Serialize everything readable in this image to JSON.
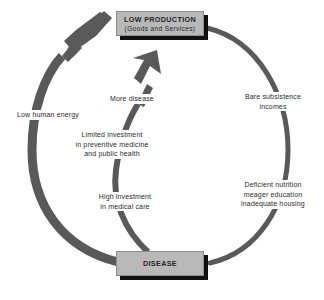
{
  "diagram": {
    "type": "cycle-diagram",
    "title": "",
    "colors": {
      "arrow": "#595959",
      "box_fill": "#b9b9b9",
      "box_border": "#8e8e8e",
      "box_shadow": "#111111",
      "text": "#2b2b2b",
      "background": "#ffffff"
    },
    "nodes": [
      {
        "id": "low-production",
        "line1": "LOW PRODUCTION",
        "line2": "(Goods and Services)"
      },
      {
        "id": "disease",
        "line1": "DISEASE",
        "line2": ""
      }
    ],
    "edge_labels": [
      {
        "id": "low-human-energy",
        "text": "Low human energy"
      },
      {
        "id": "more-disease",
        "text": "More disease"
      },
      {
        "id": "limited-investment",
        "line1": "Limited investment",
        "line2": "in preventive medicine",
        "line3": "and public health"
      },
      {
        "id": "high-investment",
        "line1": "High investment",
        "line2": "in medical care"
      },
      {
        "id": "bare-subsistence",
        "line1": "Bare subsistence",
        "line2": "incomes"
      },
      {
        "id": "deficient-nutrition",
        "line1": "Deficient nutrition",
        "line2": "meager education",
        "line3": "inadequate housing"
      }
    ]
  }
}
